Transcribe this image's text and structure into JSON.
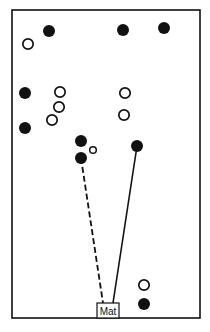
{
  "diagram": {
    "mat_label": "Mat",
    "colors": {
      "ink": "#111111",
      "background": "#ffffff"
    },
    "legend_semantics": {
      "filled": "team A player",
      "open": "team B player",
      "dashed_line": "path",
      "solid_line": "path"
    },
    "players": [
      {
        "id": "p1",
        "type": "filled"
      },
      {
        "id": "p2",
        "type": "filled"
      },
      {
        "id": "p3",
        "type": "filled"
      },
      {
        "id": "p4",
        "type": "open"
      },
      {
        "id": "p5",
        "type": "filled"
      },
      {
        "id": "p6",
        "type": "open"
      },
      {
        "id": "p7",
        "type": "open"
      },
      {
        "id": "p8",
        "type": "open"
      },
      {
        "id": "p9",
        "type": "filled"
      },
      {
        "id": "p10",
        "type": "open"
      },
      {
        "id": "p11",
        "type": "open"
      },
      {
        "id": "p12",
        "type": "filled"
      },
      {
        "id": "p13",
        "type": "open-small"
      },
      {
        "id": "p14",
        "type": "filled"
      },
      {
        "id": "p15",
        "type": "filled"
      },
      {
        "id": "p16",
        "type": "open"
      },
      {
        "id": "p17",
        "type": "filled"
      }
    ],
    "paths": [
      {
        "from": "p14",
        "to": "mat",
        "style": "dashed"
      },
      {
        "from": "p15",
        "to": "mat",
        "style": "solid"
      }
    ]
  }
}
